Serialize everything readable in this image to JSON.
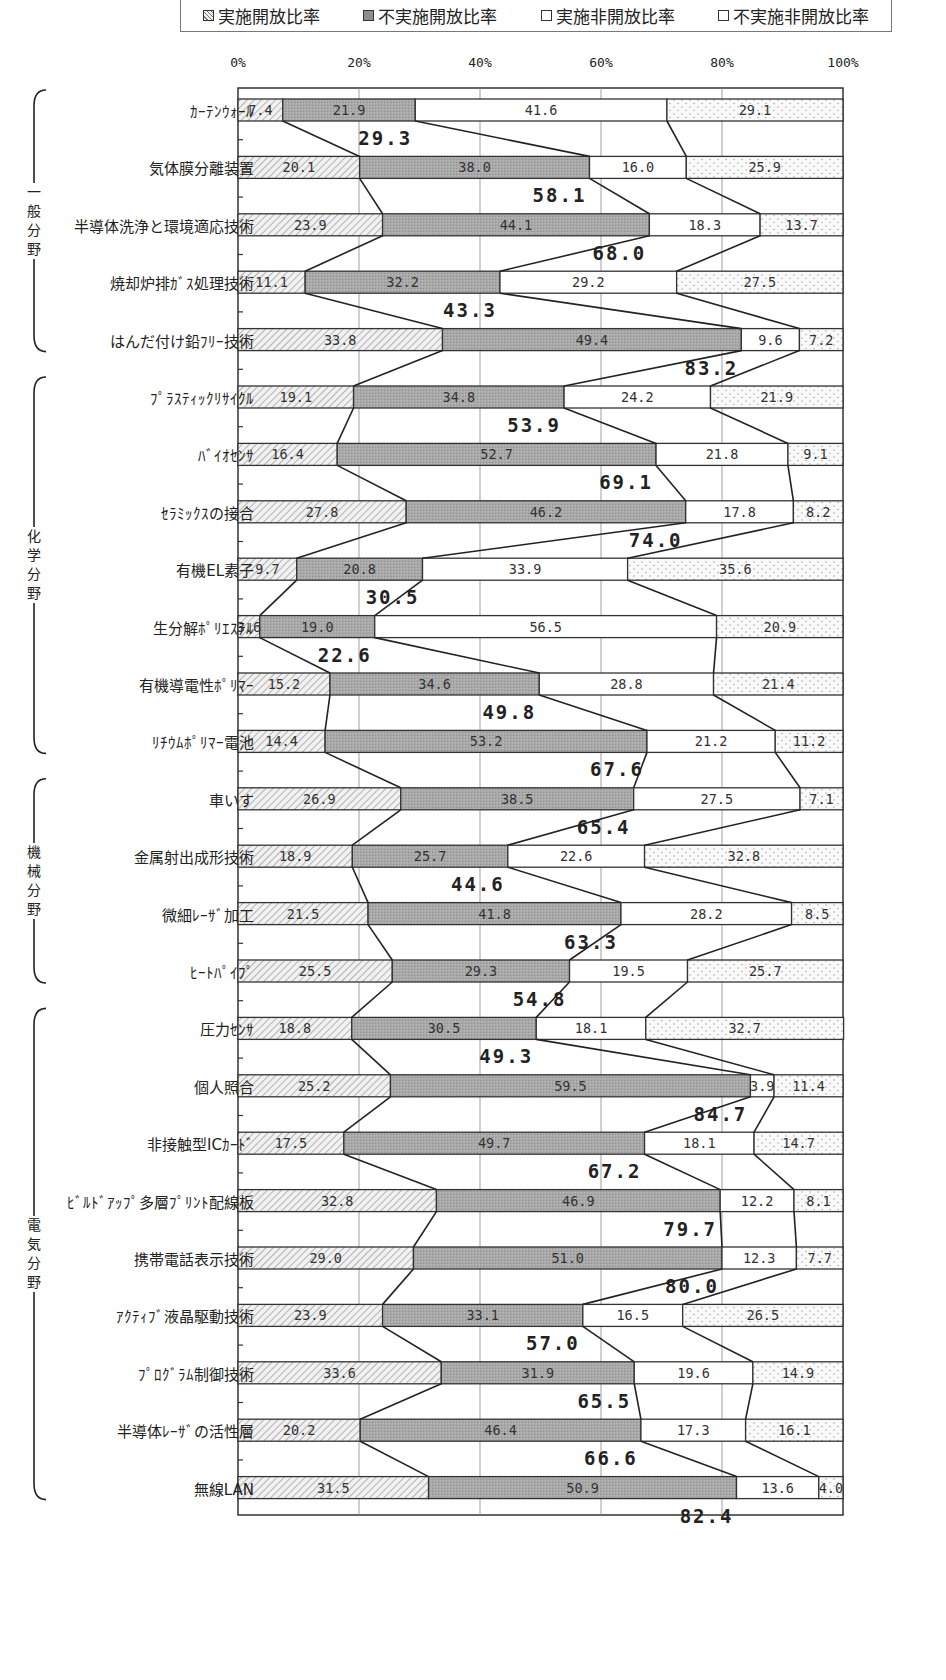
{
  "legend": [
    {
      "label": "実施開放比率",
      "pattern": "hatch"
    },
    {
      "label": "不実施開放比率",
      "pattern": "dark-stipple"
    },
    {
      "label": "実施非開放比率",
      "pattern": "white"
    },
    {
      "label": "不実施非開放比率",
      "pattern": "dots"
    }
  ],
  "x_ticks": [
    "0%",
    "20%",
    "40%",
    "60%",
    "80%",
    "100%"
  ],
  "groups": [
    {
      "label": "一般分野",
      "first": 0,
      "last": 4
    },
    {
      "label": "化学分野",
      "first": 5,
      "last": 11
    },
    {
      "label": "機械分野",
      "first": 12,
      "last": 15
    },
    {
      "label": "電気分野",
      "first": 16,
      "last": 24
    }
  ],
  "colors": {
    "hatch_bg": "#f1f1f1",
    "hatch_line": "#888888",
    "dark_fill": "#a9a9a9",
    "white_fill": "#ffffff",
    "dots_bg": "#fafafa",
    "dots_dot": "#9a9a9a",
    "border": "#333333",
    "grid": "#888888"
  },
  "chart_data": {
    "type": "bar",
    "orientation": "horizontal-stacked-100",
    "title": "",
    "xlabel": "",
    "ylabel": "",
    "xlim": [
      0,
      100
    ],
    "x_ticks": [
      "0%",
      "20%",
      "40%",
      "60%",
      "80%",
      "100%"
    ],
    "grid": true,
    "legend_position": "top",
    "series_names": [
      "実施開放比率",
      "不実施開放比率",
      "実施非開放比率",
      "不実施非開放比率"
    ],
    "categories": [
      "カーテンウォール",
      "気体膜分離装置",
      "半導体洗浄と環境適応技術",
      "焼却炉排ガス処理技術",
      "はんだ付け鉛フリー技術",
      "プラスティックリサイクル",
      "バイオセンサ",
      "セラミックスの接合",
      "有機EL素子",
      "生分解ポリエステル",
      "有機導電性ポリマー",
      "リチウムポリマー電池",
      "車いす",
      "金属射出成形技術",
      "微細レーザ加工",
      "ヒートパイプ",
      "圧力センサ",
      "個人照合",
      "非接触型ICカード",
      "ビルドアップ多層プリント配線板",
      "携帯電話表示技術",
      "アクティブ液晶駆動技術",
      "プログラム制御技術",
      "半導体レーザの活性層",
      "無線LAN"
    ],
    "display_labels": [
      "ｶｰﾃﾝｳｫｰﾙ",
      "気体膜分離装置",
      "半導体洗浄と環境適応技術",
      "焼却炉排ｶﾞｽ処理技術",
      "はんだ付け鉛ﾌﾘｰ技術",
      "ﾌﾟﾗｽﾃｨｯｸﾘｻｲｸﾙ",
      "ﾊﾞｲｵｾﾝｻ",
      "ｾﾗﾐｯｸｽの接合",
      "有機EL素子",
      "生分解ﾎﾟﾘｴｽﾃﾙ",
      "有機導電性ﾎﾟﾘﾏｰ",
      "ﾘﾁｳﾑﾎﾟﾘﾏｰ電池",
      "車いす",
      "金属射出成形技術",
      "微細ﾚｰｻﾞ加工",
      "ﾋｰﾄﾊﾟｲﾌﾟ",
      "圧力ｾﾝｻ",
      "個人照合",
      "非接触型ICｶｰﾄﾞ",
      "ﾋﾞﾙﾄﾞｱｯﾌﾟ多層ﾌﾟﾘﾝﾄ配線板",
      "携帯電話表示技術",
      "ｱｸﾃｨﾌﾞ液晶駆動技術",
      "ﾌﾟﾛｸﾞﾗﾑ制御技術",
      "半導体ﾚｰｻﾞの活性層",
      "無線LAN"
    ],
    "series": [
      {
        "name": "実施開放比率",
        "values": [
          7.4,
          20.1,
          23.9,
          11.1,
          33.8,
          19.1,
          16.4,
          27.8,
          9.7,
          3.6,
          15.2,
          14.4,
          26.9,
          18.9,
          21.5,
          25.5,
          18.8,
          25.2,
          17.5,
          32.8,
          29.0,
          23.9,
          33.6,
          20.2,
          31.5
        ]
      },
      {
        "name": "不実施開放比率",
        "values": [
          21.9,
          38.0,
          44.1,
          32.2,
          49.4,
          34.8,
          52.7,
          46.2,
          20.8,
          19.0,
          34.6,
          53.2,
          38.5,
          25.7,
          41.8,
          29.3,
          30.5,
          59.5,
          49.7,
          46.9,
          51.0,
          33.1,
          31.9,
          46.4,
          50.9
        ]
      },
      {
        "name": "実施非開放比率",
        "values": [
          41.6,
          16.0,
          18.3,
          29.2,
          9.6,
          24.2,
          21.8,
          17.8,
          33.9,
          56.5,
          28.8,
          21.2,
          27.5,
          22.6,
          28.2,
          19.5,
          18.1,
          3.9,
          18.1,
          12.2,
          12.3,
          16.5,
          19.6,
          17.3,
          13.6
        ]
      },
      {
        "name": "不実施非開放比率",
        "values": [
          29.1,
          25.9,
          13.7,
          27.5,
          7.2,
          21.9,
          9.1,
          8.2,
          35.6,
          20.9,
          21.4,
          11.2,
          7.1,
          32.8,
          8.5,
          25.7,
          32.7,
          11.4,
          14.7,
          8.1,
          7.7,
          26.5,
          14.9,
          16.1,
          4.0
        ]
      }
    ],
    "segment_labels": [
      [
        "7.4",
        "21.9",
        "41.6",
        "29.1"
      ],
      [
        "20.1",
        "38.0",
        "16.0",
        "25.9"
      ],
      [
        "23.9",
        "44.1",
        "18.3",
        "13.7"
      ],
      [
        "11.1",
        "32.2",
        "29.2",
        "27.5"
      ],
      [
        "33.8",
        "49.4",
        "9.6",
        "7.2"
      ],
      [
        "19.1",
        "34.8",
        "24.2",
        "21.9"
      ],
      [
        "16.4",
        "52.7",
        "21.8",
        "9.1"
      ],
      [
        "27.8",
        "46.2",
        "17.8",
        "8.2"
      ],
      [
        "9.7",
        "20.8",
        "33.9",
        "35.6"
      ],
      [
        "3.6",
        "19.0",
        "56.5",
        "20.9"
      ],
      [
        "15.2",
        "34.6",
        "28.8",
        "21.4"
      ],
      [
        "14.4",
        "53.2",
        "21.2",
        "11.2"
      ],
      [
        "26.9",
        "38.5",
        "27.5",
        "7.1"
      ],
      [
        "18.9",
        "25.7",
        "22.6",
        "32.8"
      ],
      [
        "21.5",
        "41.8",
        "28.2",
        "8.5"
      ],
      [
        "25.5",
        "29.3",
        "19.5",
        "25.7"
      ],
      [
        "18.8",
        "30.5",
        "18.1",
        "32.7"
      ],
      [
        "25.2",
        "59.5",
        "3.9",
        "11.4"
      ],
      [
        "17.5",
        "49.7",
        "18.1",
        "14.7"
      ],
      [
        "32.8",
        "46.9",
        "12.2",
        "8.1"
      ],
      [
        "29.0",
        "51.0",
        "12.3",
        "7.7"
      ],
      [
        "23.9",
        "33.1",
        "16.5",
        "26.5"
      ],
      [
        "33.6",
        "31.9",
        "19.6",
        "14.9"
      ],
      [
        "20.2",
        "46.4",
        "17.3",
        "16.1"
      ],
      [
        "31.5",
        "50.9",
        "13.6",
        "4.0"
      ]
    ],
    "totals_label": "開放比率合計",
    "totals": [
      "29.3",
      "58.1",
      "68.0",
      "43.3",
      "83.2",
      "53.9",
      "69.1",
      "74.0",
      "30.5",
      "22.6",
      "49.8",
      "67.6",
      "65.4",
      "44.6",
      "63.3",
      "54.8",
      "49.3",
      "84.7",
      "67.2",
      "79.7",
      "80.0",
      "57.0",
      "65.5",
      "66.6",
      "82.4"
    ]
  }
}
